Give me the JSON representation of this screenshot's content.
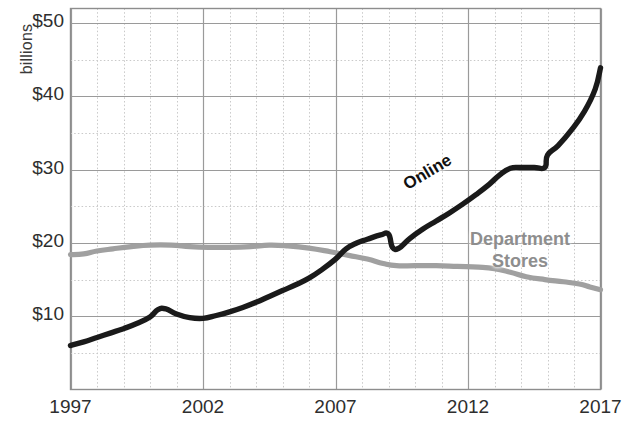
{
  "chart_data": {
    "type": "line",
    "title": "",
    "subtitle": "",
    "xlabel": "",
    "ylabel": "billions",
    "ylabel_rotated": true,
    "grid": true,
    "grid_major_x_every": 5,
    "grid_minor_x_every": 1,
    "grid_major_y_every": 10,
    "grid_minor_y_every": 5,
    "legend_position": "inline-annotations",
    "xlim": [
      1997,
      2017
    ],
    "ylim": [
      0,
      52
    ],
    "xticks": [
      1997,
      2002,
      2007,
      2012,
      2017
    ],
    "xtick_labels": [
      "1997",
      "2002",
      "2007",
      "2012",
      "2017"
    ],
    "yticks": [
      10,
      20,
      30,
      40,
      50
    ],
    "ytick_labels": [
      "$10",
      "$20",
      "$30",
      "$40",
      "$50"
    ],
    "x": [
      1997,
      1998,
      1999,
      2000,
      2001,
      2002,
      2003,
      2004,
      2005,
      2006,
      2007,
      2008,
      2009,
      2010,
      2011,
      2012,
      2013,
      2014,
      2015,
      2016,
      2017
    ],
    "series": [
      {
        "name": "Online",
        "color": "#1a1a1a",
        "width": 5,
        "label_text": "Online",
        "values": [
          6.0,
          7.2,
          8.4,
          9.8,
          11.0,
          9.7,
          10.4,
          11.6,
          13.0,
          14.6,
          16.6,
          18.3,
          20.6,
          21.0,
          19.3,
          21.0,
          23.0,
          25.6,
          28.4,
          30.3,
          30.3
        ]
      },
      {
        "name": "Department Stores",
        "color": "#a0a0a0",
        "width": 5,
        "label_line1": "Department",
        "label_line2": "Stores",
        "values": [
          18.4,
          18.7,
          19.2,
          19.6,
          19.7,
          19.5,
          19.4,
          19.6,
          19.7,
          19.4,
          19.0,
          18.4,
          17.0,
          16.9,
          16.8,
          16.7,
          16.6,
          16.2,
          15.3,
          14.7,
          13.6
        ]
      }
    ],
    "online_points": [
      [
        1997,
        6.0
      ],
      [
        1997.5,
        6.5
      ],
      [
        1998,
        7.1
      ],
      [
        1998.5,
        7.7
      ],
      [
        1999,
        8.3
      ],
      [
        1999.5,
        9.0
      ],
      [
        2000,
        9.9
      ],
      [
        2000.3,
        10.9
      ],
      [
        2000.6,
        11.0
      ],
      [
        2001,
        10.3
      ],
      [
        2001.5,
        9.8
      ],
      [
        2002,
        9.7
      ],
      [
        2002.5,
        10.1
      ],
      [
        2003,
        10.6
      ],
      [
        2003.5,
        11.2
      ],
      [
        2004,
        11.9
      ],
      [
        2004.5,
        12.7
      ],
      [
        2005,
        13.5
      ],
      [
        2005.5,
        14.3
      ],
      [
        2006,
        15.2
      ],
      [
        2006.5,
        16.4
      ],
      [
        2007,
        17.8
      ],
      [
        2007.4,
        19.2
      ],
      [
        2007.8,
        20.0
      ],
      [
        2008.2,
        20.5
      ],
      [
        2008.7,
        21.1
      ],
      [
        2009.0,
        21.2
      ],
      [
        2009.15,
        19.4
      ],
      [
        2009.4,
        19.3
      ],
      [
        2009.8,
        20.6
      ],
      [
        2010.3,
        21.9
      ],
      [
        2010.8,
        23.0
      ],
      [
        2011.3,
        24.1
      ],
      [
        2011.8,
        25.3
      ],
      [
        2012.3,
        26.6
      ],
      [
        2012.8,
        28.0
      ],
      [
        2013.2,
        29.3
      ],
      [
        2013.6,
        30.2
      ],
      [
        2014.0,
        30.3
      ],
      [
        2014.5,
        30.3
      ],
      [
        2014.9,
        30.3
      ],
      [
        2015.0,
        32.0
      ],
      [
        2015.4,
        33.3
      ],
      [
        2015.9,
        35.4
      ],
      [
        2016.4,
        38.0
      ],
      [
        2016.8,
        41.0
      ],
      [
        2017.0,
        43.9
      ]
    ],
    "department_points": [
      [
        1997,
        18.4
      ],
      [
        1997.5,
        18.5
      ],
      [
        1998,
        18.9
      ],
      [
        1998.6,
        19.2
      ],
      [
        1999.3,
        19.5
      ],
      [
        2000,
        19.7
      ],
      [
        2000.8,
        19.7
      ],
      [
        2001.5,
        19.5
      ],
      [
        2002.2,
        19.4
      ],
      [
        2003,
        19.4
      ],
      [
        2003.8,
        19.5
      ],
      [
        2004.5,
        19.7
      ],
      [
        2005.2,
        19.6
      ],
      [
        2006,
        19.3
      ],
      [
        2006.8,
        18.8
      ],
      [
        2007.5,
        18.3
      ],
      [
        2008.2,
        17.8
      ],
      [
        2008.8,
        17.2
      ],
      [
        2009.3,
        16.9
      ],
      [
        2010,
        16.9
      ],
      [
        2010.8,
        16.9
      ],
      [
        2011.6,
        16.8
      ],
      [
        2012.4,
        16.7
      ],
      [
        2013,
        16.5
      ],
      [
        2013.6,
        16.0
      ],
      [
        2014.2,
        15.4
      ],
      [
        2014.9,
        15.0
      ],
      [
        2015.6,
        14.7
      ],
      [
        2016.2,
        14.4
      ],
      [
        2016.6,
        14.0
      ],
      [
        2017,
        13.6
      ]
    ],
    "annotations": [
      {
        "text": "Online",
        "x": 2011.2,
        "y": 26.0,
        "rotation": -31,
        "color": "#111111",
        "bold": true
      },
      {
        "text": "Department Stores",
        "x": 2013.6,
        "y": 20.5,
        "rotation": 0,
        "color": "#8e8e8e",
        "bold": true
      }
    ],
    "colors": {
      "online": "#1a1a1a",
      "department": "#a0a0a0",
      "grid_major": "#9a9a9a",
      "grid_minor": "#c9c9c9",
      "axis": "#6e6e6e",
      "text": "#2e2e2e",
      "background": "#ffffff"
    }
  },
  "axis": {
    "y_title": "billions",
    "y_ticks": [
      "$50",
      "$40",
      "$30",
      "$20",
      "$10"
    ],
    "x_ticks": [
      "1997",
      "2002",
      "2007",
      "2012",
      "2017"
    ]
  },
  "labels": {
    "online": "Online",
    "department_line1": "Department",
    "department_line2": "Stores"
  }
}
